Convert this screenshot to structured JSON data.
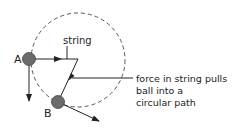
{
  "labels": {
    "ball_a": "A",
    "ball_b": "B",
    "string": "string",
    "force_line1": "force in string pulls",
    "force_line2": "ball into a",
    "force_line3": "circular path"
  },
  "colors": {
    "ball": "#6b6b6b",
    "line": "#222222",
    "circle": "#555555"
  }
}
